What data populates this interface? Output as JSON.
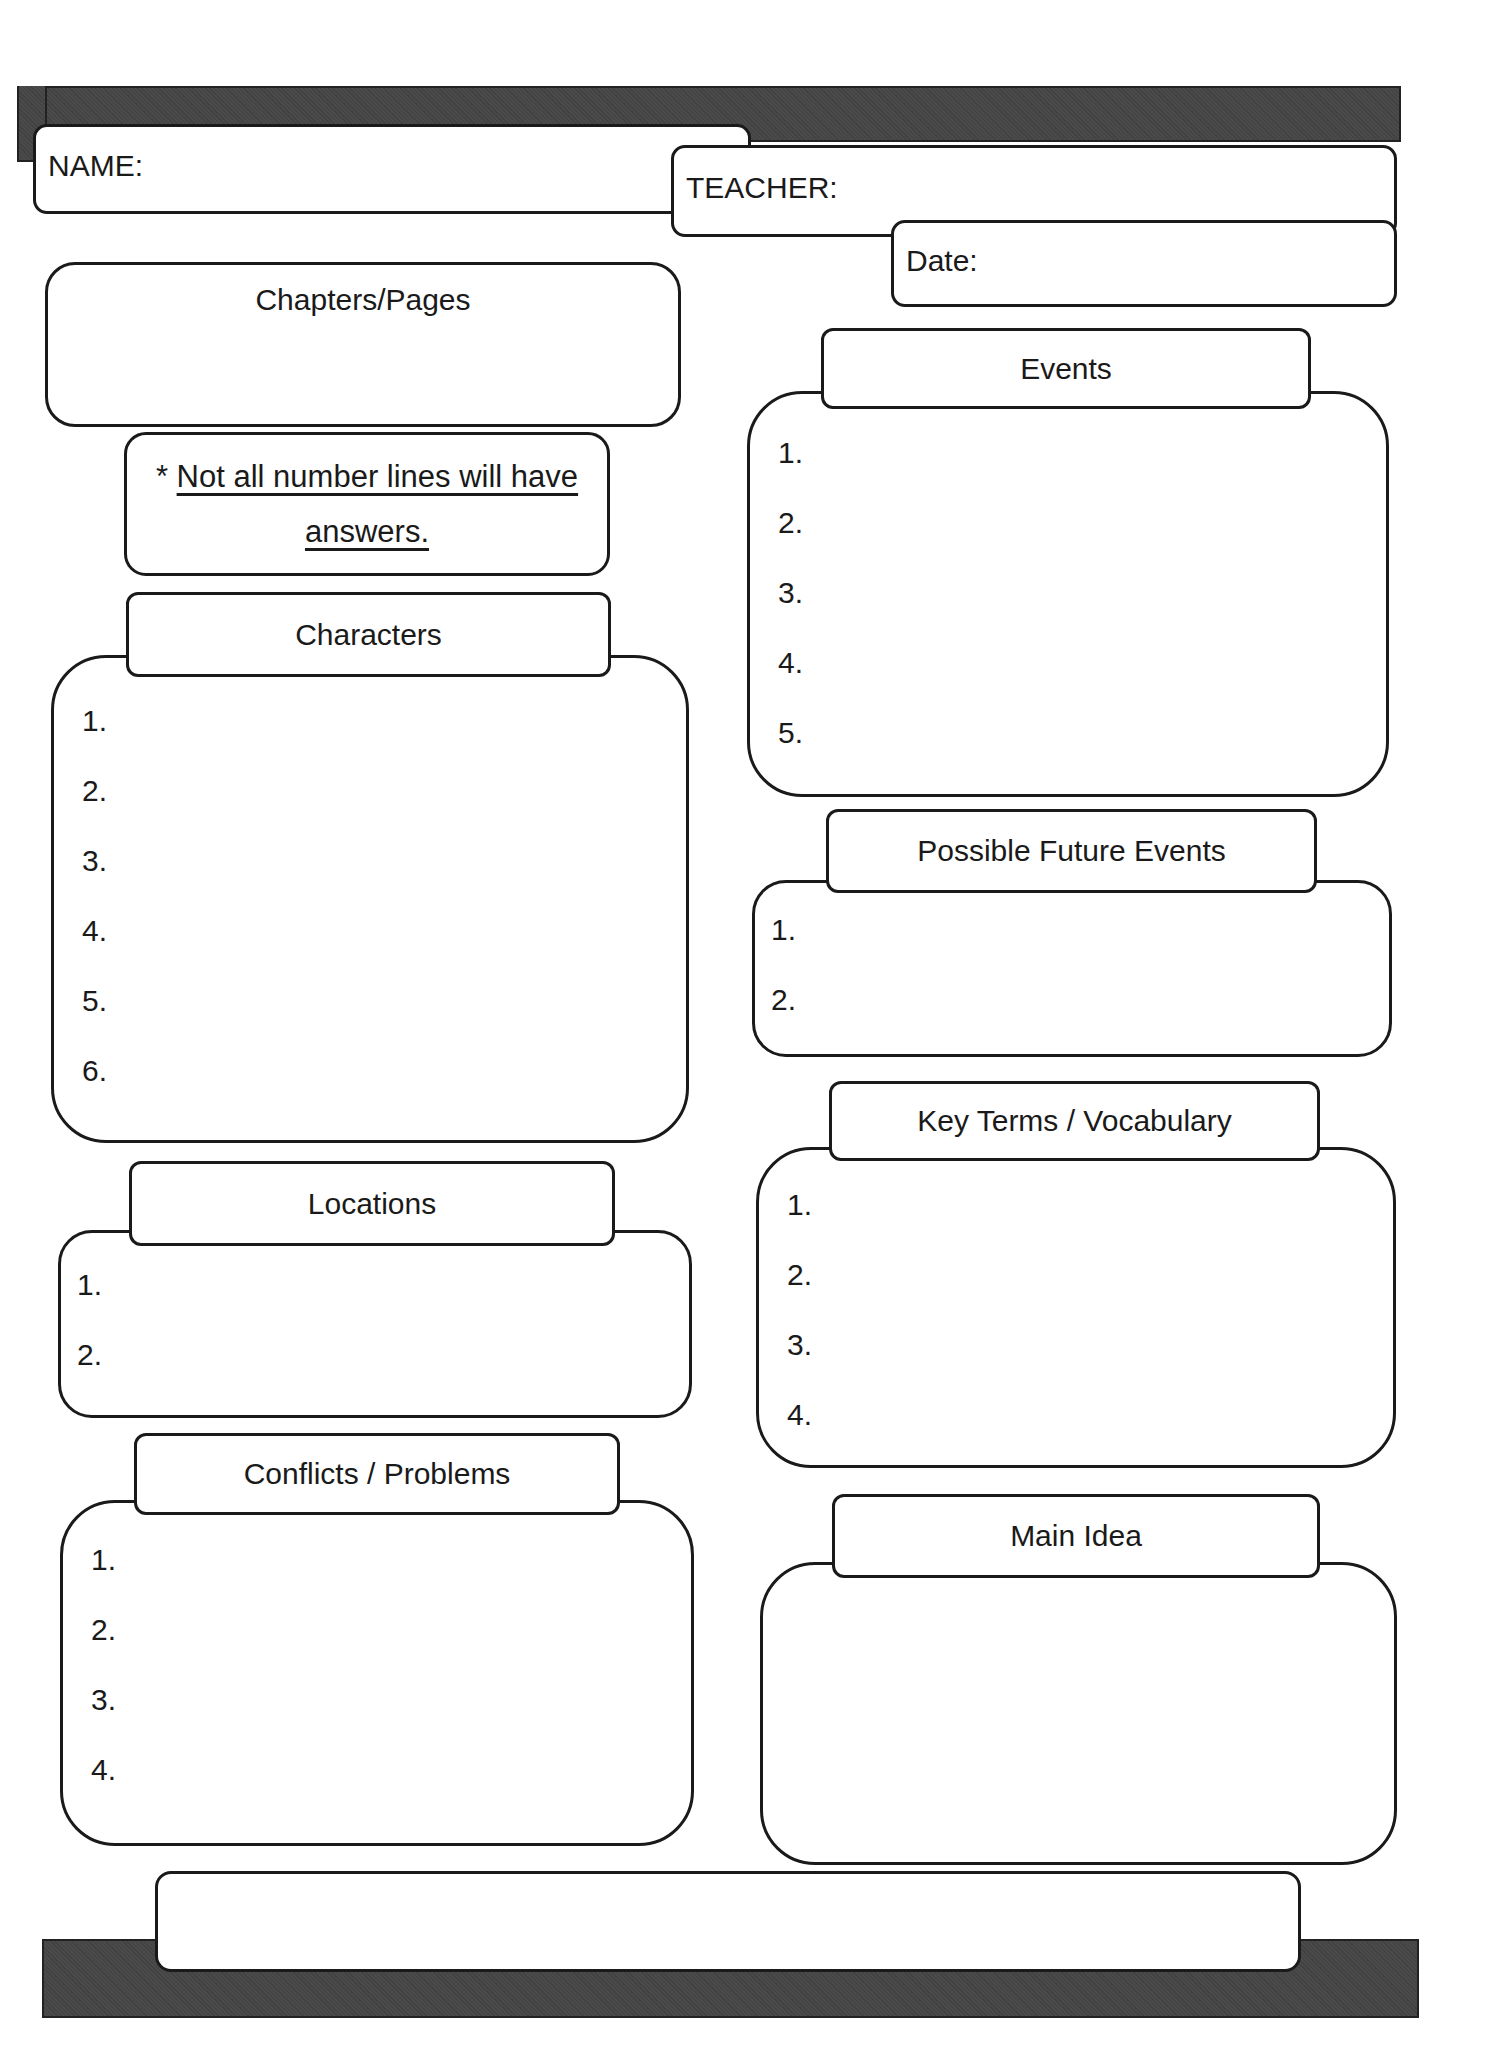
{
  "header": {
    "name_label": "NAME:",
    "teacher_label": "TEACHER:",
    "date_label": "Date:"
  },
  "chapters": {
    "title": "Chapters/Pages"
  },
  "note": {
    "star": "*",
    "line1": "Not all number lines will have",
    "line2": "answers."
  },
  "sections": {
    "characters": {
      "title": "Characters",
      "items": [
        "1.",
        "2.",
        "3.",
        "4.",
        "5.",
        "6."
      ]
    },
    "locations": {
      "title": "Locations",
      "items": [
        "1.",
        "2."
      ]
    },
    "conflicts": {
      "title": "Conflicts / Problems",
      "items": [
        "1.",
        "2.",
        "3.",
        "4."
      ]
    },
    "events": {
      "title": "Events",
      "items": [
        "1.",
        "2.",
        "3.",
        "4.",
        "5."
      ]
    },
    "future_events": {
      "title": "Possible Future Events",
      "items": [
        "1.",
        "2."
      ]
    },
    "key_terms": {
      "title": "Key Terms / Vocabulary",
      "items": [
        "1.",
        "2.",
        "3.",
        "4."
      ]
    },
    "main_idea": {
      "title": "Main Idea"
    }
  },
  "colors": {
    "bar": "#4a4a4a",
    "border": "#1a1a1a",
    "background": "#ffffff"
  }
}
